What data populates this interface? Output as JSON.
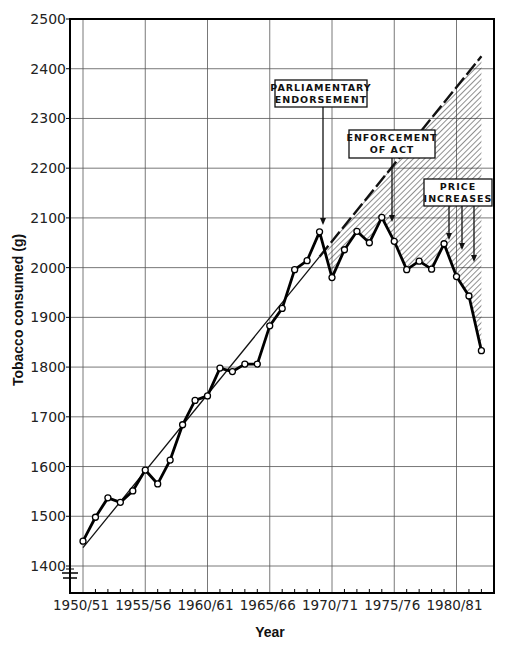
{
  "chart_data": {
    "type": "line",
    "title": "",
    "xlabel": "Year",
    "ylabel": "Tobacco consumed (g)",
    "ylim": [
      1400,
      2500
    ],
    "yticks": [
      1400,
      1500,
      1600,
      1700,
      1800,
      1900,
      2000,
      2100,
      2200,
      2300,
      2400,
      2500
    ],
    "xtick_labels": [
      "1950/51",
      "1955/56",
      "1960/61",
      "1965/66",
      "1970/71",
      "1975/76",
      "1980/81"
    ],
    "grid": true,
    "legend": null,
    "x": [
      1950,
      1951,
      1952,
      1953,
      1954,
      1955,
      1956,
      1957,
      1958,
      1959,
      1960,
      1961,
      1962,
      1963,
      1964,
      1965,
      1966,
      1967,
      1968,
      1969,
      1970,
      1971,
      1972,
      1973,
      1974,
      1975,
      1976,
      1977,
      1978,
      1979,
      1980,
      1981,
      1982
    ],
    "series": [
      {
        "name": "Tobacco consumed",
        "style": "thick line with open circle markers",
        "values": [
          1450,
          1498,
          1537,
          1528,
          1551,
          1593,
          1565,
          1613,
          1684,
          1733,
          1742,
          1798,
          1791,
          1806,
          1806,
          1883,
          1918,
          1996,
          2014,
          2072,
          1980,
          2036,
          2073,
          2050,
          2101,
          2053,
          1996,
          2013,
          1997,
          2048,
          1982,
          1943,
          1833
        ]
      },
      {
        "name": "Trend (fitted)",
        "style": "thin solid line",
        "x": [
          1950,
          1969
        ],
        "values": [
          1437,
          2022
        ]
      },
      {
        "name": "Trend (projected)",
        "style": "dashed line",
        "x": [
          1969,
          1982
        ],
        "values": [
          2022,
          2425
        ]
      }
    ],
    "shaded_region": {
      "description": "Hatched area between projected trend and actual consumption",
      "x_start": 1969,
      "x_end": 1982
    },
    "annotations": [
      {
        "lines": [
          "PARLIAMENTARY",
          "ENDORSEMENT"
        ],
        "arrow_x": [
          1969
        ]
      },
      {
        "lines": [
          "ENFORCEMENT",
          "OF ACT"
        ],
        "arrow_x": [
          1975
        ]
      },
      {
        "lines": [
          "PRICE",
          "INCREASES"
        ],
        "arrow_x": [
          1980,
          1981,
          1982
        ]
      }
    ]
  }
}
